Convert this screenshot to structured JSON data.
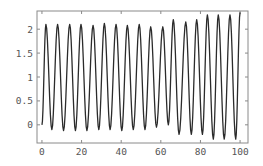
{
  "chart_data": {
    "type": "line",
    "title": "",
    "xlabel": "",
    "ylabel": "",
    "xlim": [
      -2.5,
      104
    ],
    "ylim": [
      -0.38,
      2.38
    ],
    "grid": false,
    "legend": null,
    "x_ticks": [
      0,
      20,
      40,
      60,
      80,
      100
    ],
    "x_tick_labels": [
      "0",
      "20",
      "40",
      "60",
      "80",
      "100"
    ],
    "y_ticks": [
      0,
      0.5,
      1,
      1.5,
      2
    ],
    "y_tick_labels": [
      "0",
      "0.5",
      "1",
      "1.5",
      "2"
    ],
    "series": [
      {
        "name": "oscillation",
        "color": "#2b2b2b",
        "x": [
          0,
          2.0,
          5.0,
          7.9,
          10.9,
          14.0,
          16.9,
          19.7,
          22.7,
          25.8,
          28.7,
          31.5,
          34.4,
          37.4,
          40.3,
          43.1,
          46.1,
          49.1,
          52.0,
          54.9,
          57.8,
          61.0,
          63.8,
          66.3,
          69.2,
          72.6,
          75.4,
          78.1,
          81.0,
          83.5,
          86.5,
          89.0,
          92.0,
          94.9,
          97.8,
          100
        ],
        "y": [
          0,
          2.1,
          -0.1,
          2.1,
          -0.12,
          2.1,
          -0.12,
          2.1,
          -0.12,
          2.08,
          -0.1,
          2.12,
          -0.1,
          2.1,
          -0.12,
          2.08,
          -0.1,
          2.1,
          -0.1,
          2.05,
          -0.05,
          2.05,
          0.0,
          2.2,
          -0.2,
          2.15,
          -0.2,
          2.2,
          -0.2,
          2.3,
          -0.3,
          2.3,
          -0.3,
          2.3,
          -0.3,
          2.35
        ]
      }
    ]
  },
  "plot_area": {
    "left": 37,
    "top": 11,
    "right": 248,
    "bottom": 143
  }
}
